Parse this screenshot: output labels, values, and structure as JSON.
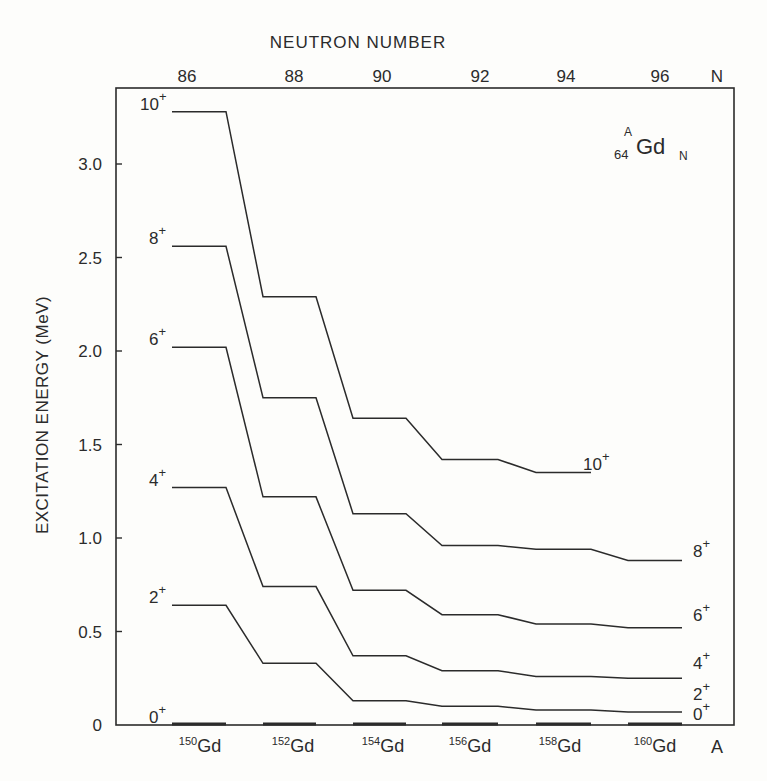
{
  "chart_data": {
    "type": "line",
    "title": "NEUTRON NUMBER",
    "xlabel_top": "NEUTRON NUMBER",
    "xlabel_top_symbol": "N",
    "xlabel_bottom_symbol": "A",
    "ylabel": "EXCITATION ENERGY (MeV)",
    "ylim": [
      0,
      3.35
    ],
    "yticks": [
      {
        "value": 0,
        "label": "0"
      },
      {
        "value": 0.5,
        "label": "0.5"
      },
      {
        "value": 1.0,
        "label": "1.0"
      },
      {
        "value": 1.5,
        "label": "1.5"
      },
      {
        "value": 2.0,
        "label": "2.0"
      },
      {
        "value": 2.5,
        "label": "2.5"
      },
      {
        "value": 3.0,
        "label": "3.0"
      }
    ],
    "top_ticks": [
      "86",
      "88",
      "90",
      "92",
      "94",
      "96"
    ],
    "categories": [
      {
        "mass": "150",
        "element": "Gd",
        "N": 86
      },
      {
        "mass": "152",
        "element": "Gd",
        "N": 88
      },
      {
        "mass": "154",
        "element": "Gd",
        "N": 90
      },
      {
        "mass": "156",
        "element": "Gd",
        "N": 92
      },
      {
        "mass": "158",
        "element": "Gd",
        "N": 94
      },
      {
        "mass": "160",
        "element": "Gd",
        "N": 96
      }
    ],
    "series": [
      {
        "name": "0+",
        "spin": "0",
        "parity": "+",
        "values": [
          0,
          0,
          0,
          0,
          0,
          0
        ]
      },
      {
        "name": "2+",
        "spin": "2",
        "parity": "+",
        "values": [
          0.64,
          0.33,
          0.13,
          0.1,
          0.08,
          0.07
        ]
      },
      {
        "name": "4+",
        "spin": "4",
        "parity": "+",
        "values": [
          1.27,
          0.74,
          0.37,
          0.29,
          0.26,
          0.25
        ]
      },
      {
        "name": "6+",
        "spin": "6",
        "parity": "+",
        "values": [
          2.02,
          1.22,
          0.72,
          0.59,
          0.54,
          0.52
        ]
      },
      {
        "name": "8+",
        "spin": "8",
        "parity": "+",
        "values": [
          2.56,
          1.75,
          1.13,
          0.96,
          0.94,
          0.88
        ]
      },
      {
        "name": "10+",
        "spin": "10",
        "parity": "+",
        "values": [
          3.28,
          2.29,
          1.64,
          1.42,
          1.35,
          null
        ]
      }
    ],
    "annotation": {
      "nuclide_symbol": "Gd",
      "superscript": "A",
      "subscript_left": "64",
      "subscript_right": "N"
    },
    "grid": false,
    "legend": "none (labels placed at ends of level lines)"
  },
  "colors": {
    "ink": "#2b2b2b",
    "background": "#fdfdfb"
  }
}
